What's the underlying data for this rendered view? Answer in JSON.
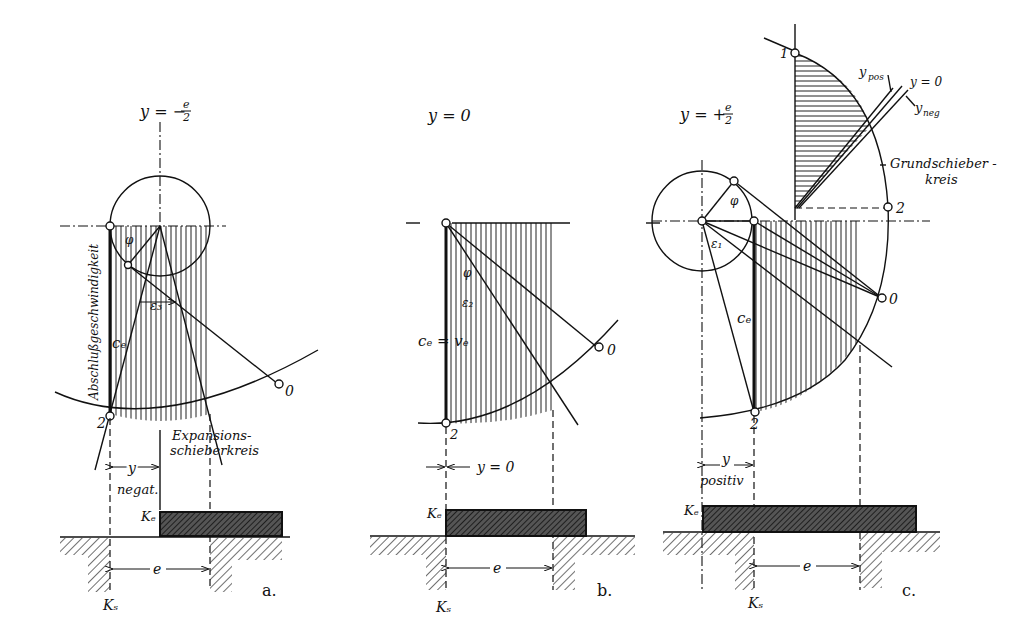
{
  "diagram": {
    "panels": [
      {
        "id": "a",
        "caption": "a.",
        "heading": "y = − e/2",
        "heading_parts": {
          "lhs": "y = −",
          "frac_num": "e",
          "frac_den": "2"
        },
        "labels": {
          "vertical_text": "Abschlußgeschwindigkeit",
          "ce": "cₑ",
          "phi": "φ",
          "epsilon": "ε₃",
          "point_0": "0",
          "point_2": "2",
          "circle_label_line1": "Expansions-",
          "circle_label_line2": "schieberkreis",
          "y_dim": "y",
          "y_note": "negat.",
          "ke": "Kₑ",
          "ks": "Kₛ",
          "e_dim": "e"
        }
      },
      {
        "id": "b",
        "caption": "b.",
        "heading": "y = 0",
        "labels": {
          "ce_ve": "cₑ = vₑ",
          "phi": "φ",
          "epsilon": "ε₂",
          "point_0": "0",
          "point_2": "2",
          "y_dim": "y = 0",
          "ke": "Kₑ",
          "ks": "Kₛ",
          "e_dim": "e"
        }
      },
      {
        "id": "c",
        "caption": "c.",
        "heading": "y = + e/2",
        "heading_parts": {
          "lhs": "y = +",
          "frac_num": "e",
          "frac_den": "2"
        },
        "labels": {
          "ce": "cₑ",
          "phi": "φ",
          "epsilon": "ε₁",
          "point_0": "0",
          "point_1": "1",
          "point_2": "2",
          "point_2_lower": "2",
          "y_pos": "y_pos",
          "y_pos_main": "y",
          "y_pos_sub": "pos",
          "y_zero": "y = 0",
          "y_neg_main": "y",
          "y_neg_sub": "neg",
          "circle_label_line1": "Grundschieber -",
          "circle_label_line2": "kreis",
          "y_dim": "y",
          "y_note": "positiv",
          "ke": "Kₑ",
          "ks": "Kₛ",
          "e_dim": "e"
        }
      }
    ]
  }
}
